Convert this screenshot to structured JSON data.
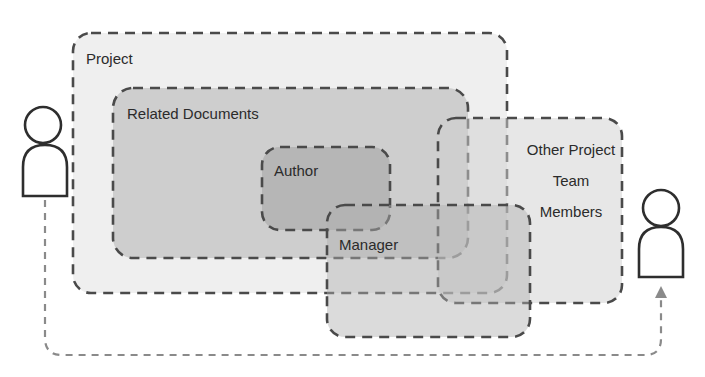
{
  "diagram": {
    "type": "overlapping-scope-sets",
    "colors": {
      "background": "#ffffff",
      "stroke": "#4a4a4a",
      "connector": "#8a8a8a",
      "project_fill": "#ececec",
      "related_fill": "#c9c9c9",
      "author_fill": "#a9a9a9",
      "other_fill": "#d8d8d8",
      "manager_fill": "#bdbdbd",
      "person_fill": "#ffffff"
    },
    "regions": {
      "project": {
        "label": "Project",
        "x": 73,
        "y": 33,
        "w": 434,
        "h": 260,
        "r": 18
      },
      "related_documents": {
        "label": "Related Documents",
        "x": 113,
        "y": 88,
        "w": 355,
        "h": 170,
        "r": 20
      },
      "author": {
        "label": "Author",
        "x": 262,
        "y": 147,
        "w": 128,
        "h": 83,
        "r": 18
      },
      "other_team": {
        "label_lines": [
          "Other Project",
          "Team",
          "Members"
        ],
        "x": 438,
        "y": 118,
        "w": 184,
        "h": 185,
        "r": 18
      },
      "manager": {
        "label": "Manager",
        "x": 327,
        "y": 205,
        "w": 203,
        "h": 132,
        "r": 18
      }
    },
    "actors": [
      {
        "id": "left-person",
        "head_cx": 43,
        "head_cy": 125,
        "head_r": 18,
        "body_x": 23,
        "body_y": 145,
        "body_w": 44,
        "body_h": 51
      },
      {
        "id": "right-person",
        "head_cx": 661,
        "head_cy": 208,
        "head_r": 18,
        "body_x": 639,
        "body_y": 227,
        "body_w": 44,
        "body_h": 51
      }
    ],
    "connector": {
      "from": "left-person",
      "to": "right-person",
      "style": "dashed",
      "arrowhead": "right-person"
    }
  }
}
